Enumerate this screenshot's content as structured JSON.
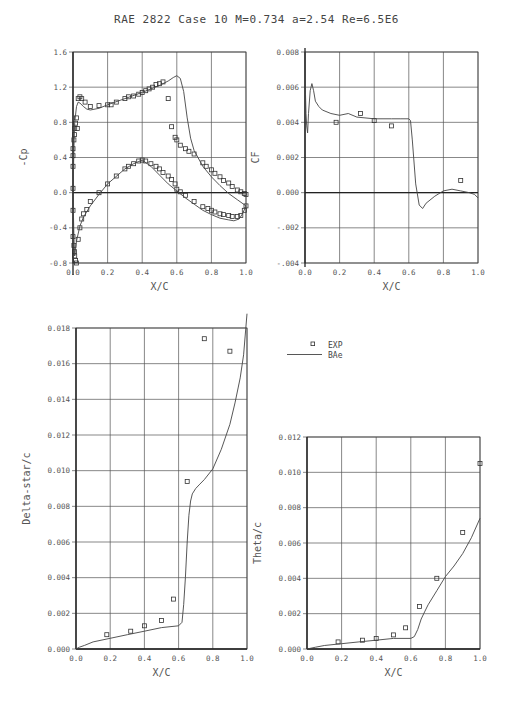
{
  "title": "RAE 2822 Case 10   M=0.734 a=2.54 Re=6.5E6",
  "legend": {
    "exp_label": "EXP",
    "model_label": "BAe"
  },
  "chart_data": [
    {
      "id": "cp",
      "type": "scatter+line",
      "title": "",
      "xlabel": "X/C",
      "ylabel": "-Cp",
      "xlim": [
        0.0,
        1.0
      ],
      "ylim": [
        -0.8,
        1.6
      ],
      "xticks": [
        "0.0",
        "0.2",
        "0.4",
        "0.6",
        "0.8",
        "1.0"
      ],
      "yticks": [
        "-0.8",
        "-0.4",
        "0.0",
        "0.4",
        "0.8",
        "1.2",
        "1.6"
      ],
      "grid": true,
      "box": {
        "x0": 73,
        "x1": 246,
        "y0": 263,
        "y1": 52
      },
      "series": [
        {
          "name": "EXP (upper)",
          "kind": "markers",
          "x": [
            0.0,
            0.0,
            0.0,
            0.0,
            0.005,
            0.008,
            0.01,
            0.015,
            0.02,
            0.025,
            0.03,
            0.04,
            0.05,
            0.07,
            0.1,
            0.15,
            0.2,
            0.22,
            0.25,
            0.3,
            0.32,
            0.35,
            0.38,
            0.4,
            0.42,
            0.44,
            0.46,
            0.48,
            0.5,
            0.52,
            0.55,
            0.57,
            0.59,
            0.6,
            0.62,
            0.65,
            0.67,
            0.7,
            0.75,
            0.77,
            0.8,
            0.82,
            0.85,
            0.87,
            0.9,
            0.92,
            0.95,
            0.97,
            0.99,
            1.0
          ],
          "y": [
            0.05,
            0.3,
            0.42,
            0.5,
            0.6,
            0.66,
            0.73,
            0.79,
            0.85,
            0.73,
            1.07,
            1.09,
            1.07,
            1.03,
            0.98,
            0.99,
            1.0,
            1.0,
            1.03,
            1.07,
            1.09,
            1.1,
            1.12,
            1.14,
            1.16,
            1.18,
            1.2,
            1.23,
            1.24,
            1.26,
            1.07,
            0.75,
            0.63,
            0.6,
            0.54,
            0.5,
            0.47,
            0.44,
            0.34,
            0.3,
            0.26,
            0.22,
            0.18,
            0.14,
            0.11,
            0.07,
            0.03,
            0.01,
            -0.01,
            -0.02
          ]
        },
        {
          "name": "EXP (lower)",
          "kind": "markers",
          "x": [
            0.0,
            0.0,
            0.005,
            0.008,
            0.01,
            0.015,
            0.02,
            0.03,
            0.04,
            0.05,
            0.06,
            0.08,
            0.1,
            0.15,
            0.2,
            0.25,
            0.3,
            0.32,
            0.35,
            0.38,
            0.4,
            0.42,
            0.45,
            0.48,
            0.5,
            0.52,
            0.55,
            0.57,
            0.59,
            0.6,
            0.62,
            0.65,
            0.7,
            0.75,
            0.78,
            0.8,
            0.82,
            0.85,
            0.87,
            0.9,
            0.92,
            0.95,
            0.97,
            0.99,
            1.0
          ],
          "y": [
            -0.2,
            -0.5,
            -0.6,
            -0.67,
            -0.72,
            -0.77,
            -0.8,
            -0.53,
            -0.4,
            -0.3,
            -0.24,
            -0.19,
            -0.1,
            0.0,
            0.1,
            0.19,
            0.27,
            0.3,
            0.33,
            0.36,
            0.37,
            0.36,
            0.33,
            0.3,
            0.27,
            0.23,
            0.19,
            0.15,
            0.1,
            0.04,
            0.01,
            -0.03,
            -0.1,
            -0.16,
            -0.18,
            -0.2,
            -0.22,
            -0.24,
            -0.25,
            -0.26,
            -0.27,
            -0.27,
            -0.26,
            -0.2,
            -0.15
          ]
        },
        {
          "name": "BAe (upper)",
          "kind": "line",
          "x": [
            0.0,
            0.005,
            0.01,
            0.02,
            0.03,
            0.04,
            0.06,
            0.08,
            0.1,
            0.15,
            0.2,
            0.3,
            0.4,
            0.5,
            0.55,
            0.58,
            0.6,
            0.62,
            0.64,
            0.66,
            0.68,
            0.7,
            0.75,
            0.8,
            0.85,
            0.9,
            0.95,
            1.0
          ],
          "y": [
            0.0,
            0.5,
            0.8,
            0.98,
            1.03,
            1.02,
            0.98,
            0.95,
            0.94,
            0.96,
            1.0,
            1.07,
            1.14,
            1.22,
            1.27,
            1.31,
            1.33,
            1.3,
            1.15,
            0.85,
            0.62,
            0.48,
            0.3,
            0.18,
            0.08,
            -0.01,
            -0.08,
            -0.15
          ]
        },
        {
          "name": "BAe (lower)",
          "kind": "line",
          "x": [
            0.0,
            0.005,
            0.01,
            0.02,
            0.04,
            0.06,
            0.1,
            0.15,
            0.2,
            0.3,
            0.35,
            0.4,
            0.45,
            0.5,
            0.55,
            0.6,
            0.65,
            0.7,
            0.75,
            0.8,
            0.85,
            0.9,
            0.93,
            0.96,
            0.98,
            1.0
          ],
          "y": [
            0.0,
            -0.5,
            -0.72,
            -0.55,
            -0.38,
            -0.28,
            -0.15,
            -0.02,
            0.1,
            0.27,
            0.33,
            0.37,
            0.3,
            0.2,
            0.1,
            0.02,
            -0.06,
            -0.13,
            -0.2,
            -0.25,
            -0.29,
            -0.31,
            -0.32,
            -0.3,
            -0.24,
            -0.15
          ]
        }
      ]
    },
    {
      "id": "cf",
      "type": "scatter+line",
      "xlabel": "X/C",
      "ylabel": "CF",
      "xlim": [
        0.0,
        1.0
      ],
      "ylim": [
        -0.004,
        0.008
      ],
      "xticks": [
        "0.0",
        "0.2",
        "0.4",
        "0.6",
        "0.8",
        "1.0"
      ],
      "yticks": [
        "-.004",
        "-.002",
        "0.000",
        "0.002",
        "0.004",
        "0.006",
        "0.008"
      ],
      "grid": true,
      "box": {
        "x0": 305,
        "x1": 478,
        "y0": 263,
        "y1": 52
      },
      "series": [
        {
          "name": "EXP",
          "kind": "markers",
          "x": [
            0.18,
            0.32,
            0.4,
            0.5,
            0.9
          ],
          "y": [
            0.004,
            0.0045,
            0.0041,
            0.0038,
            0.0007
          ]
        },
        {
          "name": "BAe",
          "kind": "line",
          "x": [
            0.0,
            0.003,
            0.006,
            0.01,
            0.015,
            0.02,
            0.03,
            0.04,
            0.05,
            0.06,
            0.08,
            0.1,
            0.15,
            0.2,
            0.25,
            0.3,
            0.4,
            0.5,
            0.55,
            0.6,
            0.61,
            0.62,
            0.64,
            0.66,
            0.68,
            0.7,
            0.75,
            0.8,
            0.85,
            0.9,
            0.95,
            0.98,
            1.0
          ],
          "y": [
            0.008,
            0.0056,
            0.0045,
            0.0038,
            0.0034,
            0.0045,
            0.0058,
            0.0062,
            0.0058,
            0.0052,
            0.0049,
            0.0047,
            0.0045,
            0.0044,
            0.0045,
            0.0043,
            0.0042,
            0.0042,
            0.0042,
            0.0042,
            0.0041,
            0.003,
            0.0005,
            -0.0007,
            -0.0009,
            -0.0006,
            -0.0002,
            0.0001,
            0.0002,
            0.0001,
            0.0,
            -0.0001,
            -0.0003
          ]
        }
      ]
    },
    {
      "id": "delta-star",
      "type": "scatter+line",
      "xlabel": "X/C",
      "ylabel": "Delta-star/c",
      "xlim": [
        0.0,
        1.0
      ],
      "ylim": [
        0.0,
        0.018
      ],
      "xticks": [
        "0.0",
        "0.2",
        "0.4",
        "0.6",
        "0.8",
        "1.0"
      ],
      "yticks": [
        "0.000",
        "0.002",
        "0.004",
        "0.006",
        "0.008",
        "0.010",
        "0.012",
        "0.014",
        "0.016",
        "0.018"
      ],
      "grid": true,
      "box": {
        "x0": 76,
        "x1": 247,
        "y0": 649,
        "y1": 328
      },
      "series": [
        {
          "name": "EXP",
          "kind": "markers",
          "x": [
            0.18,
            0.32,
            0.4,
            0.5,
            0.57,
            0.65,
            0.75,
            0.9
          ],
          "y": [
            0.0008,
            0.001,
            0.0013,
            0.0016,
            0.0028,
            0.0094,
            0.0174,
            0.0167
          ]
        },
        {
          "name": "BAe",
          "kind": "line",
          "x": [
            0.0,
            0.02,
            0.05,
            0.1,
            0.2,
            0.3,
            0.4,
            0.5,
            0.6,
            0.62,
            0.63,
            0.64,
            0.65,
            0.66,
            0.67,
            0.68,
            0.7,
            0.72,
            0.75,
            0.8,
            0.85,
            0.9,
            0.93,
            0.96,
            0.98,
            1.0
          ],
          "y": [
            0.0,
            0.0001,
            0.0002,
            0.0004,
            0.0006,
            0.0008,
            0.001,
            0.0012,
            0.0013,
            0.0015,
            0.0025,
            0.004,
            0.006,
            0.0075,
            0.0083,
            0.0087,
            0.009,
            0.0092,
            0.0095,
            0.0101,
            0.0112,
            0.0126,
            0.0138,
            0.0152,
            0.0165,
            0.0188
          ]
        }
      ]
    },
    {
      "id": "theta",
      "type": "scatter+line",
      "xlabel": "X/C",
      "ylabel": "Theta/c",
      "xlim": [
        0.0,
        1.0
      ],
      "ylim": [
        0.0,
        0.012
      ],
      "xticks": [
        "0.0",
        "0.2",
        "0.4",
        "0.6",
        "0.8",
        "1.0"
      ],
      "yticks": [
        "0.000",
        "0.002",
        "0.004",
        "0.006",
        "0.008",
        "0.010",
        "0.012"
      ],
      "grid": true,
      "box": {
        "x0": 307,
        "x1": 480,
        "y0": 649,
        "y1": 437
      },
      "series": [
        {
          "name": "EXP",
          "kind": "markers",
          "x": [
            0.18,
            0.32,
            0.4,
            0.5,
            0.57,
            0.65,
            0.75,
            0.9,
            1.0
          ],
          "y": [
            0.0004,
            0.0005,
            0.0006,
            0.0008,
            0.0012,
            0.0024,
            0.004,
            0.0066,
            0.0105
          ]
        },
        {
          "name": "BAe",
          "kind": "line",
          "x": [
            0.0,
            0.05,
            0.1,
            0.2,
            0.3,
            0.4,
            0.5,
            0.6,
            0.62,
            0.64,
            0.66,
            0.68,
            0.7,
            0.75,
            0.8,
            0.85,
            0.9,
            0.95,
            1.0
          ],
          "y": [
            0.0,
            0.0001,
            0.0002,
            0.0003,
            0.0004,
            0.0005,
            0.0006,
            0.0006,
            0.0007,
            0.0011,
            0.0017,
            0.0021,
            0.0025,
            0.0033,
            0.0041,
            0.0047,
            0.0054,
            0.0063,
            0.0074
          ]
        }
      ]
    }
  ]
}
